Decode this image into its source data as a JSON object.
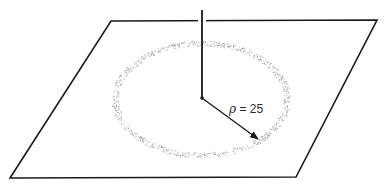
{
  "diagram": {
    "title": "",
    "plane": {
      "corners": [
        [
          111,
          21
        ],
        [
          377,
          20
        ],
        [
          296,
          177
        ],
        [
          10,
          178
        ]
      ],
      "stroke": "#1a1a1a",
      "stroke_width": 1.6
    },
    "vertical_axis": {
      "x": 202,
      "y_top": 10,
      "y_bottom": 98,
      "stroke": "#1a1a1a",
      "stroke_width": 1.8,
      "gap_in_plane_edge": true
    },
    "center_point": {
      "x": 202,
      "y": 98
    },
    "ring": {
      "cx": 201,
      "cy": 99,
      "rx": 86,
      "ry": 56,
      "band_width": 7,
      "dot_color": "#8a8a8a",
      "style": "stippled"
    },
    "radius_vector": {
      "from": [
        202,
        98
      ],
      "to": [
        258,
        139
      ],
      "stroke": "#1a1a1a"
    },
    "label": {
      "symbol": "ρ",
      "equals": " = ",
      "value": "25",
      "x": 229,
      "y": 102
    }
  }
}
